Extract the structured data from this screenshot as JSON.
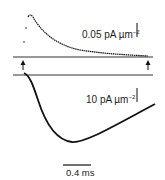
{
  "figure": {
    "upper_trace": {
      "scale_label": "0.05 pA µm",
      "scale_exponent": "−2"
    },
    "lower_trace": {
      "scale_label": "10 pA µm",
      "scale_exponent": "−2"
    },
    "time_scale": {
      "label": "0.4 ms"
    },
    "markers": {
      "left_arrow": "▲",
      "right_arrow": "▲"
    },
    "colors": {
      "trace": "#111111",
      "baseline": "#333333",
      "background": "#ffffff"
    }
  }
}
